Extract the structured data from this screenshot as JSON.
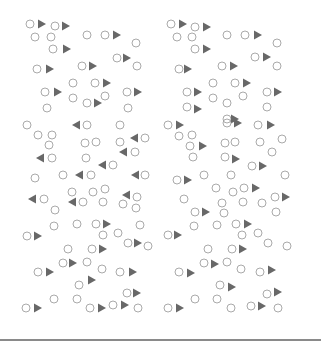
{
  "colors": {
    "background": "#ffffff",
    "circle_stroke": "#a0a0a0",
    "triangle_fill": "#686868",
    "divider": "#8a8a8a"
  },
  "shape_sizes": {
    "circle_radius": 4,
    "triangle_width": 8,
    "triangle_height": 9
  },
  "panels": [
    {
      "name": "left-panel",
      "elements": [
        {
          "t": "c",
          "x": 30,
          "y": 24
        },
        {
          "t": "r",
          "x": 42,
          "y": 24
        },
        {
          "t": "c",
          "x": 55,
          "y": 26
        },
        {
          "t": "r",
          "x": 66,
          "y": 26
        },
        {
          "t": "c",
          "x": 35,
          "y": 37
        },
        {
          "t": "c",
          "x": 51,
          "y": 37
        },
        {
          "t": "c",
          "x": 87,
          "y": 35
        },
        {
          "t": "c",
          "x": 105,
          "y": 35
        },
        {
          "t": "r",
          "x": 117,
          "y": 35
        },
        {
          "t": "c",
          "x": 136,
          "y": 43
        },
        {
          "t": "c",
          "x": 53,
          "y": 49
        },
        {
          "t": "r",
          "x": 67,
          "y": 49
        },
        {
          "t": "c",
          "x": 117,
          "y": 58
        },
        {
          "t": "r",
          "x": 127,
          "y": 58
        },
        {
          "t": "c",
          "x": 137,
          "y": 66
        },
        {
          "t": "c",
          "x": 37,
          "y": 69
        },
        {
          "t": "r",
          "x": 50,
          "y": 69
        },
        {
          "t": "c",
          "x": 82,
          "y": 66
        },
        {
          "t": "r",
          "x": 93,
          "y": 66
        },
        {
          "t": "c",
          "x": 73,
          "y": 83
        },
        {
          "t": "c",
          "x": 95,
          "y": 83
        },
        {
          "t": "r",
          "x": 107,
          "y": 83
        },
        {
          "t": "c",
          "x": 45,
          "y": 92
        },
        {
          "t": "r",
          "x": 58,
          "y": 92
        },
        {
          "t": "c",
          "x": 127,
          "y": 92
        },
        {
          "t": "r",
          "x": 138,
          "y": 92
        },
        {
          "t": "c",
          "x": 73,
          "y": 98
        },
        {
          "t": "c",
          "x": 105,
          "y": 96
        },
        {
          "t": "c",
          "x": 87,
          "y": 103
        },
        {
          "t": "r",
          "x": 98,
          "y": 103
        },
        {
          "t": "c",
          "x": 47,
          "y": 108
        },
        {
          "t": "c",
          "x": 128,
          "y": 108
        },
        {
          "t": "c",
          "x": 27,
          "y": 125
        },
        {
          "t": "l",
          "x": 76,
          "y": 125
        },
        {
          "t": "c",
          "x": 87,
          "y": 125
        },
        {
          "t": "c",
          "x": 120,
          "y": 125
        },
        {
          "t": "c",
          "x": 38,
          "y": 135
        },
        {
          "t": "c",
          "x": 52,
          "y": 135
        },
        {
          "t": "c",
          "x": 49,
          "y": 145
        },
        {
          "t": "c",
          "x": 85,
          "y": 143
        },
        {
          "t": "c",
          "x": 96,
          "y": 142
        },
        {
          "t": "c",
          "x": 120,
          "y": 142
        },
        {
          "t": "l",
          "x": 134,
          "y": 138
        },
        {
          "t": "c",
          "x": 145,
          "y": 138
        },
        {
          "t": "l",
          "x": 40,
          "y": 158
        },
        {
          "t": "c",
          "x": 52,
          "y": 158
        },
        {
          "t": "l",
          "x": 123,
          "y": 152
        },
        {
          "t": "c",
          "x": 135,
          "y": 152
        },
        {
          "t": "c",
          "x": 86,
          "y": 158
        },
        {
          "t": "l",
          "x": 102,
          "y": 165
        },
        {
          "t": "c",
          "x": 113,
          "y": 165
        },
        {
          "t": "c",
          "x": 35,
          "y": 178
        },
        {
          "t": "c",
          "x": 63,
          "y": 175
        },
        {
          "t": "l",
          "x": 79,
          "y": 175
        },
        {
          "t": "c",
          "x": 91,
          "y": 175
        },
        {
          "t": "l",
          "x": 135,
          "y": 175
        },
        {
          "t": "c",
          "x": 145,
          "y": 175
        },
        {
          "t": "c",
          "x": 72,
          "y": 192
        },
        {
          "t": "c",
          "x": 93,
          "y": 192
        },
        {
          "t": "c",
          "x": 105,
          "y": 189
        },
        {
          "t": "l",
          "x": 32,
          "y": 199
        },
        {
          "t": "c",
          "x": 44,
          "y": 199
        },
        {
          "t": "l",
          "x": 72,
          "y": 202
        },
        {
          "t": "c",
          "x": 83,
          "y": 202
        },
        {
          "t": "c",
          "x": 103,
          "y": 202
        },
        {
          "t": "l",
          "x": 126,
          "y": 195
        },
        {
          "t": "c",
          "x": 137,
          "y": 197
        },
        {
          "t": "c",
          "x": 123,
          "y": 204
        },
        {
          "t": "c",
          "x": 136,
          "y": 208
        },
        {
          "t": "c",
          "x": 55,
          "y": 210
        },
        {
          "t": "c",
          "x": 54,
          "y": 226
        },
        {
          "t": "c",
          "x": 77,
          "y": 224
        },
        {
          "t": "c",
          "x": 96,
          "y": 224
        },
        {
          "t": "r",
          "x": 107,
          "y": 224
        },
        {
          "t": "c",
          "x": 140,
          "y": 225
        },
        {
          "t": "c",
          "x": 27,
          "y": 236
        },
        {
          "t": "r",
          "x": 38,
          "y": 236
        },
        {
          "t": "c",
          "x": 103,
          "y": 235
        },
        {
          "t": "c",
          "x": 118,
          "y": 233
        },
        {
          "t": "c",
          "x": 128,
          "y": 243
        },
        {
          "t": "r",
          "x": 138,
          "y": 243
        },
        {
          "t": "c",
          "x": 148,
          "y": 246
        },
        {
          "t": "c",
          "x": 68,
          "y": 249
        },
        {
          "t": "c",
          "x": 92,
          "y": 249
        },
        {
          "t": "r",
          "x": 103,
          "y": 249
        },
        {
          "t": "c",
          "x": 63,
          "y": 263
        },
        {
          "t": "r",
          "x": 73,
          "y": 263
        },
        {
          "t": "c",
          "x": 87,
          "y": 262
        },
        {
          "t": "c",
          "x": 38,
          "y": 272
        },
        {
          "t": "r",
          "x": 50,
          "y": 272
        },
        {
          "t": "c",
          "x": 102,
          "y": 269
        },
        {
          "t": "c",
          "x": 120,
          "y": 272
        },
        {
          "t": "r",
          "x": 133,
          "y": 272
        },
        {
          "t": "c",
          "x": 79,
          "y": 285
        },
        {
          "t": "r",
          "x": 92,
          "y": 280
        },
        {
          "t": "c",
          "x": 127,
          "y": 293
        },
        {
          "t": "r",
          "x": 137,
          "y": 293
        },
        {
          "t": "c",
          "x": 54,
          "y": 299
        },
        {
          "t": "c",
          "x": 77,
          "y": 299
        },
        {
          "t": "c",
          "x": 26,
          "y": 308
        },
        {
          "t": "r",
          "x": 38,
          "y": 308
        },
        {
          "t": "c",
          "x": 90,
          "y": 308
        },
        {
          "t": "r",
          "x": 102,
          "y": 308
        },
        {
          "t": "c",
          "x": 113,
          "y": 305
        },
        {
          "t": "r",
          "x": 125,
          "y": 305
        },
        {
          "t": "c",
          "x": 138,
          "y": 308
        }
      ]
    },
    {
      "name": "right-panel",
      "elements": [
        {
          "t": "c",
          "x": 171,
          "y": 24
        },
        {
          "t": "r",
          "x": 183,
          "y": 24
        },
        {
          "t": "c",
          "x": 195,
          "y": 27
        },
        {
          "t": "r",
          "x": 207,
          "y": 27
        },
        {
          "t": "c",
          "x": 177,
          "y": 37
        },
        {
          "t": "c",
          "x": 192,
          "y": 37
        },
        {
          "t": "c",
          "x": 227,
          "y": 35
        },
        {
          "t": "c",
          "x": 245,
          "y": 35
        },
        {
          "t": "r",
          "x": 258,
          "y": 35
        },
        {
          "t": "c",
          "x": 277,
          "y": 43
        },
        {
          "t": "c",
          "x": 195,
          "y": 49
        },
        {
          "t": "r",
          "x": 207,
          "y": 49
        },
        {
          "t": "c",
          "x": 255,
          "y": 57
        },
        {
          "t": "r",
          "x": 267,
          "y": 57
        },
        {
          "t": "c",
          "x": 277,
          "y": 66
        },
        {
          "t": "c",
          "x": 179,
          "y": 69
        },
        {
          "t": "r",
          "x": 188,
          "y": 69
        },
        {
          "t": "c",
          "x": 222,
          "y": 66
        },
        {
          "t": "r",
          "x": 234,
          "y": 66
        },
        {
          "t": "c",
          "x": 213,
          "y": 83
        },
        {
          "t": "c",
          "x": 235,
          "y": 83
        },
        {
          "t": "r",
          "x": 247,
          "y": 83
        },
        {
          "t": "c",
          "x": 187,
          "y": 92
        },
        {
          "t": "r",
          "x": 198,
          "y": 92
        },
        {
          "t": "c",
          "x": 267,
          "y": 92
        },
        {
          "t": "r",
          "x": 278,
          "y": 92
        },
        {
          "t": "c",
          "x": 213,
          "y": 98
        },
        {
          "t": "c",
          "x": 243,
          "y": 96
        },
        {
          "t": "c",
          "x": 227,
          "y": 103
        },
        {
          "t": "c",
          "x": 187,
          "y": 107
        },
        {
          "t": "r",
          "x": 198,
          "y": 109
        },
        {
          "t": "c",
          "x": 267,
          "y": 107
        },
        {
          "t": "c",
          "x": 227,
          "y": 119
        },
        {
          "t": "r",
          "x": 235,
          "y": 119
        },
        {
          "t": "c",
          "x": 168,
          "y": 125
        },
        {
          "t": "r",
          "x": 180,
          "y": 125
        },
        {
          "t": "c",
          "x": 227,
          "y": 123
        },
        {
          "t": "r",
          "x": 238,
          "y": 123
        },
        {
          "t": "c",
          "x": 258,
          "y": 125
        },
        {
          "t": "r",
          "x": 271,
          "y": 125
        },
        {
          "t": "c",
          "x": 179,
          "y": 136
        },
        {
          "t": "c",
          "x": 192,
          "y": 135
        },
        {
          "t": "c",
          "x": 190,
          "y": 146
        },
        {
          "t": "r",
          "x": 203,
          "y": 146
        },
        {
          "t": "c",
          "x": 225,
          "y": 143
        },
        {
          "t": "c",
          "x": 235,
          "y": 142
        },
        {
          "t": "c",
          "x": 260,
          "y": 142
        },
        {
          "t": "c",
          "x": 282,
          "y": 139
        },
        {
          "t": "c",
          "x": 193,
          "y": 157
        },
        {
          "t": "c",
          "x": 272,
          "y": 152
        },
        {
          "t": "c",
          "x": 225,
          "y": 157
        },
        {
          "t": "r",
          "x": 236,
          "y": 159
        },
        {
          "t": "c",
          "x": 252,
          "y": 166
        },
        {
          "t": "r",
          "x": 263,
          "y": 166
        },
        {
          "t": "c",
          "x": 177,
          "y": 180
        },
        {
          "t": "r",
          "x": 188,
          "y": 180
        },
        {
          "t": "c",
          "x": 204,
          "y": 175
        },
        {
          "t": "c",
          "x": 231,
          "y": 175
        },
        {
          "t": "c",
          "x": 285,
          "y": 175
        },
        {
          "t": "c",
          "x": 216,
          "y": 188
        },
        {
          "t": "c",
          "x": 233,
          "y": 192
        },
        {
          "t": "c",
          "x": 244,
          "y": 188
        },
        {
          "t": "r",
          "x": 256,
          "y": 188
        },
        {
          "t": "c",
          "x": 184,
          "y": 199
        },
        {
          "t": "c",
          "x": 222,
          "y": 203
        },
        {
          "t": "c",
          "x": 243,
          "y": 202
        },
        {
          "t": "c",
          "x": 262,
          "y": 203
        },
        {
          "t": "c",
          "x": 275,
          "y": 197
        },
        {
          "t": "r",
          "x": 286,
          "y": 197
        },
        {
          "t": "c",
          "x": 195,
          "y": 212
        },
        {
          "t": "r",
          "x": 206,
          "y": 212
        },
        {
          "t": "c",
          "x": 224,
          "y": 213
        },
        {
          "t": "c",
          "x": 276,
          "y": 212
        },
        {
          "t": "c",
          "x": 194,
          "y": 226
        },
        {
          "t": "c",
          "x": 217,
          "y": 225
        },
        {
          "t": "c",
          "x": 236,
          "y": 224
        },
        {
          "t": "r",
          "x": 248,
          "y": 224
        },
        {
          "t": "c",
          "x": 168,
          "y": 235
        },
        {
          "t": "r",
          "x": 178,
          "y": 235
        },
        {
          "t": "c",
          "x": 242,
          "y": 235
        },
        {
          "t": "c",
          "x": 258,
          "y": 233
        },
        {
          "t": "c",
          "x": 268,
          "y": 243
        },
        {
          "t": "c",
          "x": 287,
          "y": 246
        },
        {
          "t": "c",
          "x": 208,
          "y": 249
        },
        {
          "t": "c",
          "x": 232,
          "y": 249
        },
        {
          "t": "r",
          "x": 243,
          "y": 249
        },
        {
          "t": "c",
          "x": 204,
          "y": 263
        },
        {
          "t": "r",
          "x": 215,
          "y": 264
        },
        {
          "t": "c",
          "x": 227,
          "y": 262
        },
        {
          "t": "c",
          "x": 179,
          "y": 272
        },
        {
          "t": "r",
          "x": 191,
          "y": 273
        },
        {
          "t": "c",
          "x": 241,
          "y": 269
        },
        {
          "t": "c",
          "x": 260,
          "y": 272
        },
        {
          "t": "r",
          "x": 272,
          "y": 270
        },
        {
          "t": "c",
          "x": 220,
          "y": 285
        },
        {
          "t": "r",
          "x": 232,
          "y": 287
        },
        {
          "t": "c",
          "x": 267,
          "y": 294
        },
        {
          "t": "r",
          "x": 278,
          "y": 292
        },
        {
          "t": "c",
          "x": 195,
          "y": 299
        },
        {
          "t": "c",
          "x": 217,
          "y": 299
        },
        {
          "t": "c",
          "x": 168,
          "y": 308
        },
        {
          "t": "r",
          "x": 180,
          "y": 308
        },
        {
          "t": "c",
          "x": 231,
          "y": 308
        },
        {
          "t": "c",
          "x": 251,
          "y": 306
        },
        {
          "t": "r",
          "x": 262,
          "y": 306
        },
        {
          "t": "c",
          "x": 278,
          "y": 308
        }
      ]
    }
  ]
}
